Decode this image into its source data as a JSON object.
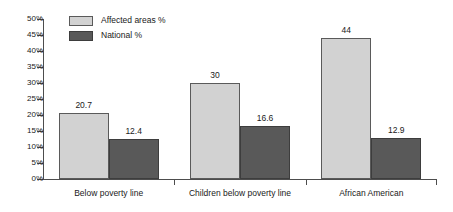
{
  "chart_data": {
    "type": "bar",
    "title": "",
    "subtitle": "",
    "xlabel": "",
    "ylabel": "",
    "grid": false,
    "legend_position": "top-left",
    "categories": [
      "Below poverty line",
      "Children below poverty line",
      "African American"
    ],
    "series": [
      {
        "name": "Affected areas %",
        "color": "#d2d2d2",
        "values": [
          20.7,
          30,
          44
        ],
        "labels": [
          "20.7",
          "30",
          "44"
        ]
      },
      {
        "name": "National %",
        "color": "#595959",
        "values": [
          12.4,
          16.6,
          12.9
        ],
        "labels": [
          "12.4",
          "16.6",
          "12.9"
        ]
      }
    ],
    "ylim": [
      0,
      50
    ],
    "ytick_values": [
      0,
      5,
      10,
      15,
      20,
      25,
      30,
      35,
      40,
      45,
      50
    ],
    "ytick_labels": [
      "0%",
      "5%",
      "10%",
      "15%",
      "20%",
      "25%",
      "30%",
      "35%",
      "40%",
      "45%",
      "50%"
    ]
  },
  "legend": {
    "items": [
      {
        "label": "Affected areas %",
        "swatch": "light"
      },
      {
        "label": "National %",
        "swatch": "dark"
      }
    ]
  }
}
